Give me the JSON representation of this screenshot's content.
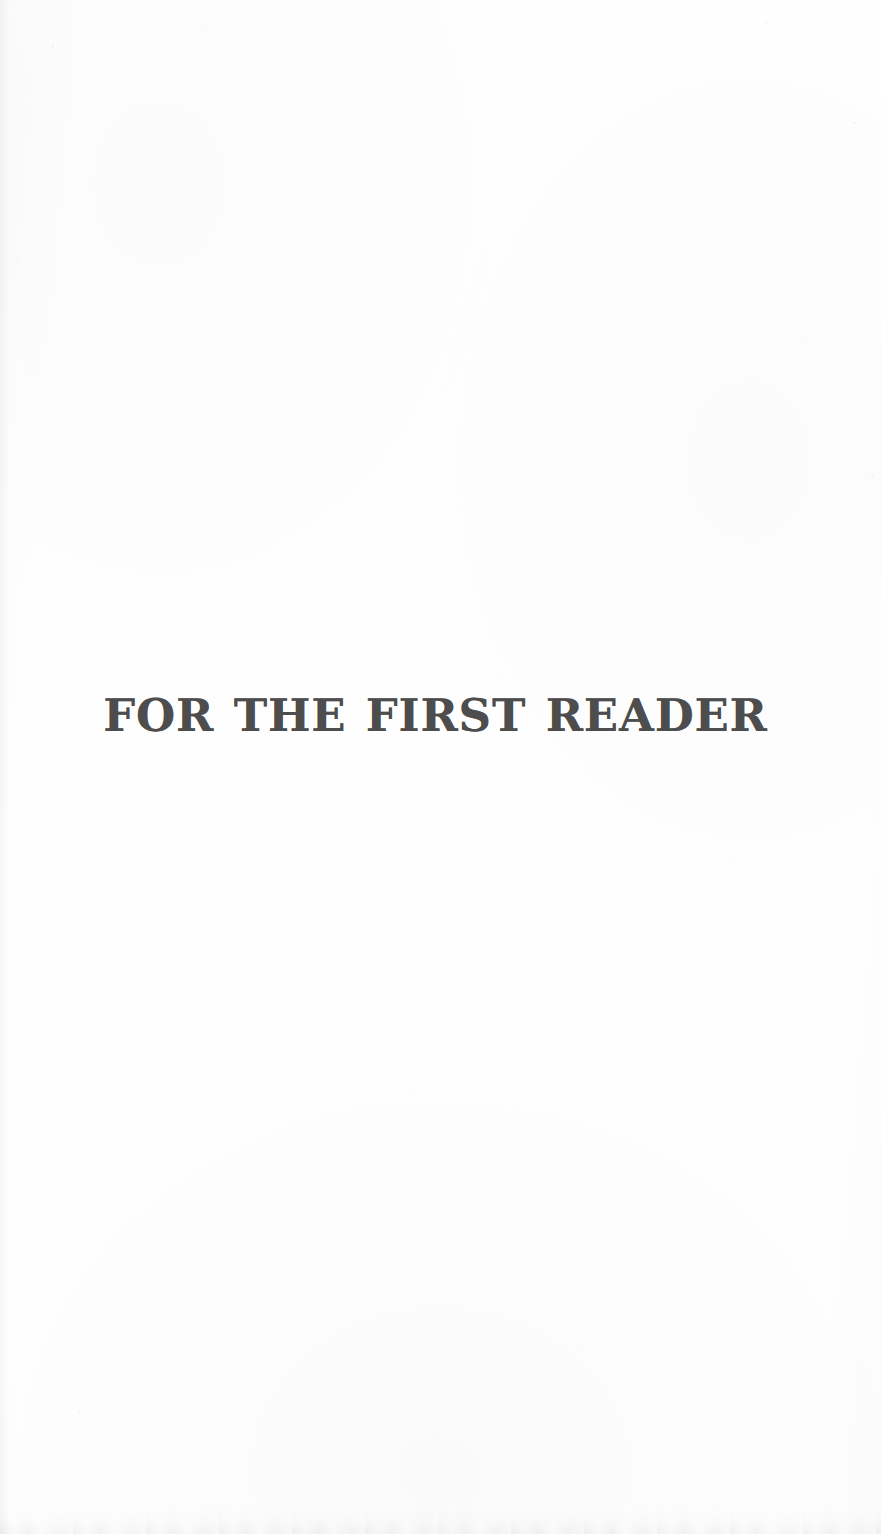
{
  "page": {
    "type": "scanned-book-page",
    "role": "half-title / dedication page",
    "background_color": "#fefefe",
    "width": 881,
    "height": 1534
  },
  "content": {
    "half_title": "FOR THE FIRST READER",
    "text_color": "#4d4d4d",
    "alignment": "center"
  },
  "artifacts": {
    "speckle_label": "scan-speckle-noise",
    "bottom_smudge_label": "bottom-edge-smudge",
    "gutter_label": "left-gutter-shadow",
    "tint_label": "paper-tint"
  }
}
